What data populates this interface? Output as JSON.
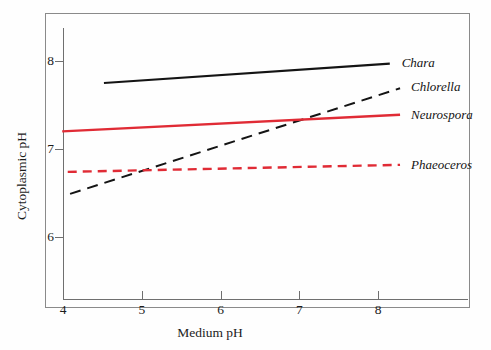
{
  "figure": {
    "background": "#fefefe",
    "frame_color": "#8a8a8a",
    "axis_color": "#6f6f6f"
  },
  "chart_data": {
    "type": "line",
    "title": "",
    "xlabel": "Medium pH",
    "ylabel": "Cytoplasmic pH",
    "xlim": [
      3.75,
      8.9
    ],
    "ylim": [
      5.55,
      8.45
    ],
    "xticks": [
      4,
      5,
      6,
      7,
      8
    ],
    "yticks": [
      6,
      7,
      8
    ],
    "xtick_labels": [
      "4",
      "5",
      "6",
      "7",
      "8"
    ],
    "ytick_labels": [
      "6",
      "7",
      "8"
    ],
    "grid": false,
    "legend_position": "right-inline",
    "series": [
      {
        "name": "Chara",
        "color": "#141414",
        "style": "solid",
        "width": 2.2,
        "x": [
          4.52,
          8.15
        ],
        "y": [
          7.75,
          7.97
        ],
        "label_x": 8.3,
        "label_y": 7.98
      },
      {
        "name": "Chlorella",
        "color": "#141414",
        "style": "dashed",
        "width": 2.0,
        "dash": "11,7",
        "x": [
          4.09,
          8.28
        ],
        "y": [
          6.49,
          7.69
        ],
        "label_x": 8.42,
        "label_y": 7.7
      },
      {
        "name": "Neurospora",
        "color": "#e02b35",
        "style": "solid",
        "width": 2.4,
        "x": [
          3.99,
          8.28
        ],
        "y": [
          7.2,
          7.39
        ],
        "label_x": 8.42,
        "label_y": 7.39
      },
      {
        "name": "Phaeoceros",
        "color": "#e02b35",
        "style": "dashed",
        "width": 2.4,
        "dash": "9,6",
        "x": [
          4.06,
          8.28
        ],
        "y": [
          6.74,
          6.82
        ],
        "label_x": 8.42,
        "label_y": 6.82
      }
    ]
  }
}
